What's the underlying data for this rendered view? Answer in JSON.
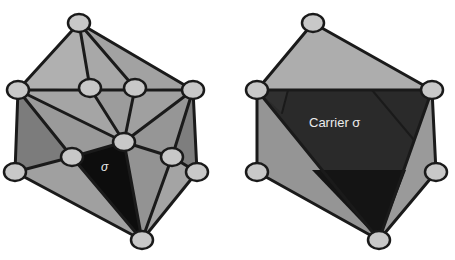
{
  "figures": [
    {
      "name": "triangulated-complex",
      "label": "σ",
      "colors": {
        "face_light": "#a9a9a9",
        "face_mid": "#8e8e8e",
        "face_dark": "#7a7a7a",
        "simplex": "#0d0d0d"
      }
    },
    {
      "name": "carrier-complex",
      "label": "Carrier σ",
      "colors": {
        "face_light": "#a9a9a9",
        "face_mid": "#8e8e8e",
        "carrier": "#2a2a2a",
        "carrier_dark": "#141414"
      }
    }
  ]
}
